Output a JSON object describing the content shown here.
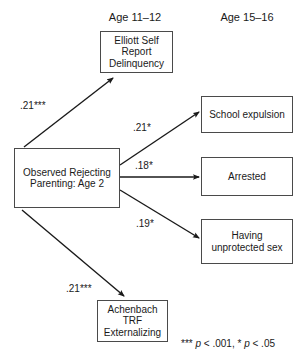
{
  "figure": {
    "type": "path-diagram",
    "background": "#ffffff",
    "line_color": "#1a1a1a",
    "box_border_color": "#4a4a4a"
  },
  "column_headers": [
    {
      "label": "Age 11–12",
      "name": "column-header-age-11-12"
    },
    {
      "label": "Age 15–16",
      "name": "column-header-age-15-16"
    }
  ],
  "nodes": {
    "predictor": {
      "label": "Observed Rejecting Parenting: Age 2"
    },
    "delinquency": {
      "label": "Elliott Self Report Delinquency"
    },
    "externalizing": {
      "label": "Achenbach TRF Externalizing"
    },
    "expulsion": {
      "label": "School expulsion"
    },
    "arrested": {
      "label": "Arrested"
    },
    "unprotected_sex": {
      "label": "Having unprotected sex"
    }
  },
  "paths": [
    {
      "from": "predictor",
      "to": "delinquency",
      "coefficient": ".21***"
    },
    {
      "from": "predictor",
      "to": "expulsion",
      "coefficient": ".21*"
    },
    {
      "from": "predictor",
      "to": "arrested",
      "coefficient": ".18*"
    },
    {
      "from": "predictor",
      "to": "unprotected_sex",
      "coefficient": ".19*"
    },
    {
      "from": "predictor",
      "to": "externalizing",
      "coefficient": ".21***"
    }
  ],
  "legend": {
    "stars_high": "***",
    "p_symbol": "p",
    "value_high": "< .001, ",
    "stars_low": "*",
    "p_symbol_2": "p",
    "value_low": "< .05"
  }
}
